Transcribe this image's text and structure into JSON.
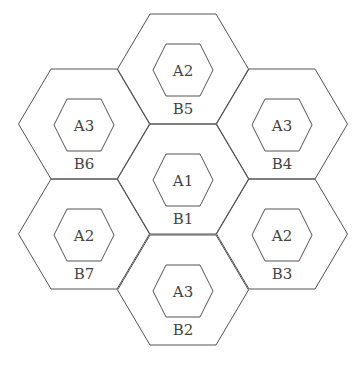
{
  "diagram": {
    "type": "hexagonal-cell-layout",
    "stroke_color": "#555555",
    "text_color": "#444444",
    "cells": [
      {
        "id": "B1",
        "inner_label": "A1",
        "outer_label": "B1",
        "cx": 183,
        "cy": 179
      },
      {
        "id": "B2",
        "inner_label": "A3",
        "outer_label": "B2",
        "cx": 183,
        "cy": 290
      },
      {
        "id": "B3",
        "inner_label": "A2",
        "outer_label": "B3",
        "cx": 282,
        "cy": 234
      },
      {
        "id": "B4",
        "inner_label": "A3",
        "outer_label": "B4",
        "cx": 282,
        "cy": 124
      },
      {
        "id": "B5",
        "inner_label": "A2",
        "outer_label": "B5",
        "cx": 183,
        "cy": 69
      },
      {
        "id": "B6",
        "inner_label": "A3",
        "outer_label": "B6",
        "cx": 84,
        "cy": 124
      },
      {
        "id": "B7",
        "inner_label": "A2",
        "outer_label": "B7",
        "cx": 84,
        "cy": 234
      }
    ]
  }
}
